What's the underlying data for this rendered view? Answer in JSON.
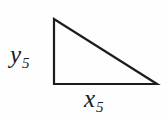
{
  "figure": {
    "type": "right-triangle",
    "stroke_color": "#1c1c1c",
    "background_color": "#fefefe",
    "labels": {
      "vertical_leg": {
        "variable": "y",
        "subscript": "5"
      },
      "horizontal_leg": {
        "variable": "x",
        "subscript": "5"
      }
    }
  }
}
